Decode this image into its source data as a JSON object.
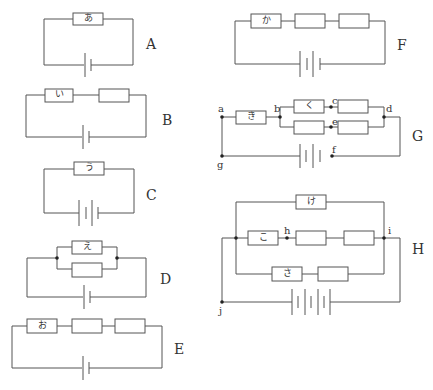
{
  "figure": {
    "circuits": [
      {
        "id": "A",
        "label": "A",
        "resistors": [
          "あ"
        ],
        "battery_cells": 1,
        "topology": "single resistor"
      },
      {
        "id": "B",
        "label": "B",
        "resistors": [
          "い",
          ""
        ],
        "battery_cells": 1,
        "topology": "2 resistors in series"
      },
      {
        "id": "C",
        "label": "C",
        "resistors": [
          "う"
        ],
        "battery_cells": 2,
        "topology": "single resistor, 2 cells in series"
      },
      {
        "id": "D",
        "label": "D",
        "resistors": [
          "え",
          ""
        ],
        "battery_cells": 1,
        "topology": "2 resistors in parallel"
      },
      {
        "id": "E",
        "label": "E",
        "resistors": [
          "お",
          "",
          ""
        ],
        "battery_cells": 1,
        "topology": "3 resistors in series"
      },
      {
        "id": "F",
        "label": "F",
        "resistors": [
          "か",
          "",
          ""
        ],
        "battery_cells": 2,
        "topology": "3 resistors in series, 2 cells"
      },
      {
        "id": "G",
        "label": "G",
        "resistors": [
          "き",
          "く",
          "",
          "",
          ""
        ],
        "battery_cells": 2,
        "points": [
          "a",
          "b",
          "c",
          "d",
          "e",
          "f",
          "g"
        ],
        "topology": "き in series with two parallel branches of 2 resistors each"
      },
      {
        "id": "H",
        "label": "H",
        "resistors": [
          "け",
          "こ",
          "",
          "",
          "さ",
          ""
        ],
        "battery_cells": 3,
        "points": [
          "h",
          "i",
          "j"
        ],
        "topology": "three parallel branches: け (1 resistor), こ + 2 (3 resistors), さ + 1 (2 resistors)"
      }
    ],
    "labels": {
      "A": "A",
      "B": "B",
      "C": "C",
      "D": "D",
      "E": "E",
      "F": "F",
      "G": "G",
      "H": "H",
      "a": "a",
      "b": "b",
      "c": "c",
      "d": "d",
      "e": "e",
      "f": "f",
      "g": "g",
      "h": "h",
      "i": "i",
      "j": "j",
      "r_a": "あ",
      "r_i": "い",
      "r_u": "う",
      "r_e": "え",
      "r_o": "お",
      "r_ka": "か",
      "r_ki": "き",
      "r_ku": "く",
      "r_ke": "け",
      "r_ko": "こ",
      "r_sa": "さ"
    }
  }
}
